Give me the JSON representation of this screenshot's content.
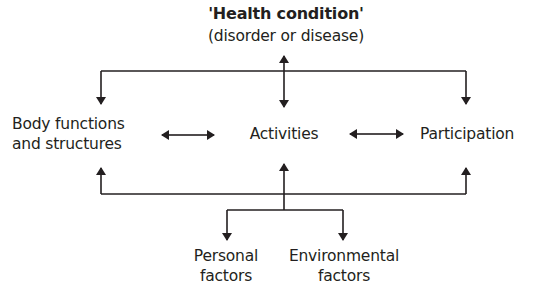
{
  "diagram": {
    "title": "'Health condition'",
    "subtitle": "(disorder or disease)",
    "nodes": {
      "body": {
        "line1": "Body functions",
        "line2": "and structures"
      },
      "activities": {
        "label": "Activities"
      },
      "participation": {
        "label": "Participation"
      },
      "personal": {
        "line1": "Personal",
        "line2": "factors"
      },
      "environmental": {
        "line1": "Environmental",
        "line2": "factors"
      }
    },
    "colors": {
      "line": "#231f20",
      "text": "#231f20",
      "background": "#ffffff"
    }
  }
}
